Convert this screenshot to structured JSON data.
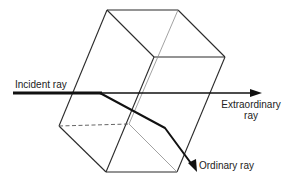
{
  "diagram": {
    "labels": {
      "incident": "Incident ray",
      "extraordinary_line1": "Extraordinary",
      "extraordinary_line2": "ray",
      "ordinary": "Ordinary ray"
    },
    "colors": {
      "background": "#ffffff",
      "line": "#2a2a2a",
      "ray": "#111111"
    }
  }
}
